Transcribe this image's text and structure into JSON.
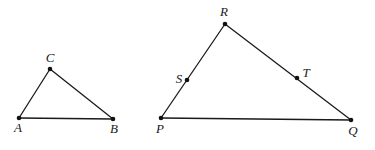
{
  "diagram": {
    "type": "geometry-similar-triangles",
    "stroke_color": "#1a1a1a",
    "background": "#ffffff",
    "triangles": [
      {
        "name": "ABC",
        "vertices": [
          {
            "label": "A",
            "x": 19,
            "y": 118,
            "label_x": 18,
            "label_y": 132
          },
          {
            "label": "B",
            "x": 113,
            "y": 119,
            "label_x": 114,
            "label_y": 133
          },
          {
            "label": "C",
            "x": 50,
            "y": 69,
            "label_x": 50,
            "label_y": 62
          }
        ]
      },
      {
        "name": "PQR",
        "vertices": [
          {
            "label": "P",
            "x": 161,
            "y": 118,
            "label_x": 160,
            "label_y": 133
          },
          {
            "label": "Q",
            "x": 351,
            "y": 120,
            "label_x": 353,
            "label_y": 135
          },
          {
            "label": "R",
            "x": 225,
            "y": 24,
            "label_x": 224,
            "label_y": 16
          }
        ],
        "points_on_sides": [
          {
            "label": "S",
            "on_side": "PR",
            "x": 187,
            "y": 80,
            "label_x": 179,
            "label_y": 83
          },
          {
            "label": "T",
            "on_side": "RQ",
            "x": 297,
            "y": 78,
            "label_x": 306,
            "label_y": 77
          }
        ]
      }
    ],
    "labels": {
      "A": "A",
      "B": "B",
      "C": "C",
      "P": "P",
      "Q": "Q",
      "R": "R",
      "S": "S",
      "T": "T"
    }
  }
}
